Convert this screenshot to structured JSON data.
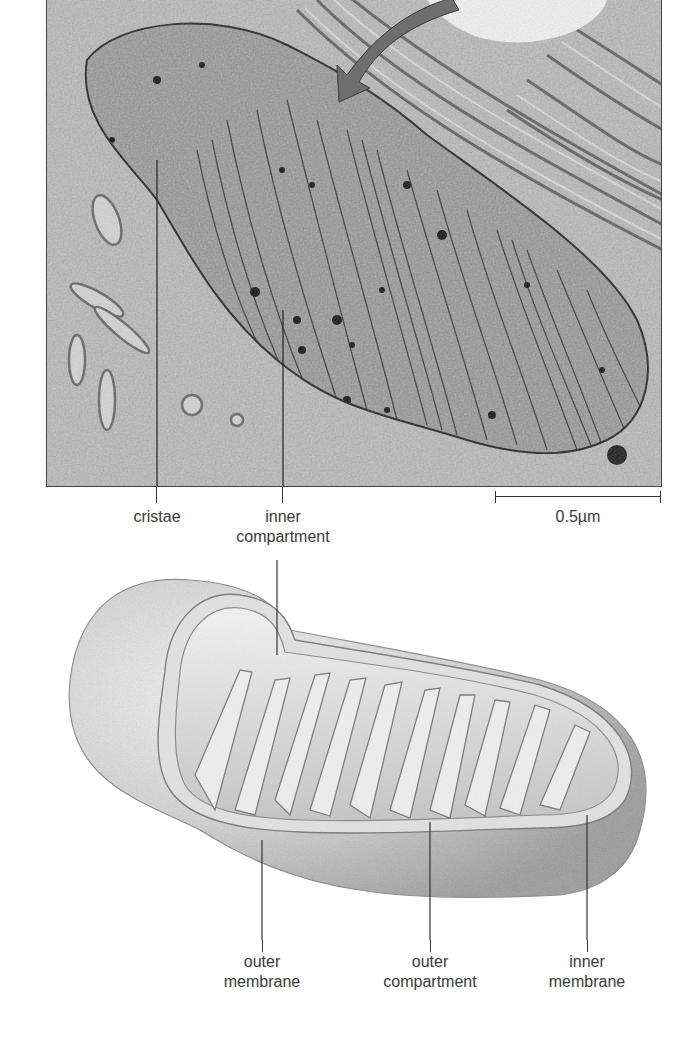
{
  "figure": {
    "micrograph": {
      "description": "electron micrograph of mitochondrion",
      "scale_bar": {
        "label": "0.5µm"
      },
      "labels": [
        {
          "id": "cristae",
          "text": "cristae"
        },
        {
          "id": "inner-compartment",
          "line1": "inner",
          "line2": "compartment"
        }
      ]
    },
    "illustration": {
      "description": "3D cutaway drawing of mitochondrion",
      "labels": [
        {
          "id": "outer-membrane",
          "line1": "outer",
          "line2": "membrane"
        },
        {
          "id": "outer-compartment",
          "line1": "outer",
          "line2": "compartment"
        },
        {
          "id": "inner-membrane",
          "line1": "inner",
          "line2": "membrane"
        }
      ]
    }
  },
  "colors": {
    "arrow": "#6e6e6e",
    "micrograph_bg": "#a9a9a9",
    "illustration_shade": "#c8c8c8",
    "text": "#3a3a3a"
  }
}
